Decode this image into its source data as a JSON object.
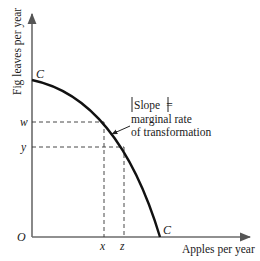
{
  "diagram": {
    "type": "production-possibility-frontier",
    "y_axis_label": "Fig leaves per year",
    "x_axis_label": "Apples per year",
    "origin_label": "O",
    "curve_label_top": "C",
    "curve_label_bottom": "C",
    "y_ticks": [
      "w",
      "y"
    ],
    "x_ticks": [
      "x",
      "z"
    ],
    "annotation": {
      "line1": "|Slope| =",
      "line2": "marginal rate",
      "line3": "of transformation"
    },
    "colors": {
      "axis": "#6b6b6b",
      "curve": "#111111",
      "dashed": "#333333",
      "text": "#1a1a1a"
    }
  }
}
